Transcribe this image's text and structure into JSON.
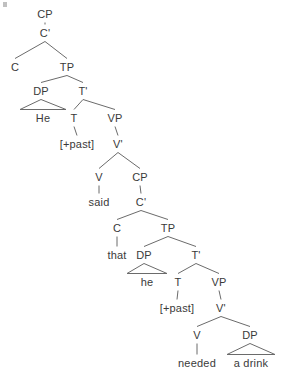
{
  "diagram": {
    "type": "syntax-tree",
    "title": "",
    "sentence": "He said that he needed a drink",
    "line_color": "#6b6b6b",
    "text_color": "#3a3a3a",
    "background": "#ffffff",
    "nodes": [
      {
        "id": "cp1",
        "label": "CP",
        "x": 45,
        "y": 14,
        "kind": "phrase"
      },
      {
        "id": "cbar1",
        "label": "C'",
        "x": 45,
        "y": 33,
        "kind": "phrase"
      },
      {
        "id": "c1",
        "label": "C",
        "x": 15,
        "y": 67,
        "kind": "head"
      },
      {
        "id": "tp1",
        "label": "TP",
        "x": 67,
        "y": 67,
        "kind": "phrase"
      },
      {
        "id": "dp1",
        "label": "DP",
        "x": 41,
        "y": 91,
        "kind": "phrase"
      },
      {
        "id": "tbar1",
        "label": "T'",
        "x": 83,
        "y": 91,
        "kind": "phrase"
      },
      {
        "id": "he1",
        "label": "He",
        "x": 43,
        "y": 118,
        "kind": "terminal"
      },
      {
        "id": "t1",
        "label": "T",
        "x": 74,
        "y": 118,
        "kind": "head"
      },
      {
        "id": "vp1",
        "label": "VP",
        "x": 115,
        "y": 118,
        "kind": "phrase"
      },
      {
        "id": "past1",
        "label": "[+past]",
        "x": 77,
        "y": 144,
        "kind": "terminal"
      },
      {
        "id": "vbar1",
        "label": "V'",
        "x": 118,
        "y": 144,
        "kind": "phrase"
      },
      {
        "id": "v1",
        "label": "V",
        "x": 99,
        "y": 177,
        "kind": "head"
      },
      {
        "id": "cp2",
        "label": "CP",
        "x": 140,
        "y": 177,
        "kind": "phrase"
      },
      {
        "id": "said",
        "label": "said",
        "x": 99,
        "y": 202,
        "kind": "terminal"
      },
      {
        "id": "cbar2",
        "label": "C'",
        "x": 141,
        "y": 202,
        "kind": "phrase"
      },
      {
        "id": "c2",
        "label": "C",
        "x": 117,
        "y": 228,
        "kind": "head"
      },
      {
        "id": "tp2",
        "label": "TP",
        "x": 168,
        "y": 228,
        "kind": "phrase"
      },
      {
        "id": "that",
        "label": "that",
        "x": 117,
        "y": 255,
        "kind": "terminal"
      },
      {
        "id": "dp2",
        "label": "DP",
        "x": 144,
        "y": 255,
        "kind": "phrase"
      },
      {
        "id": "tbar2",
        "label": "T'",
        "x": 196,
        "y": 255,
        "kind": "phrase"
      },
      {
        "id": "he2",
        "label": "he",
        "x": 147,
        "y": 282,
        "kind": "terminal"
      },
      {
        "id": "t2",
        "label": "T",
        "x": 178,
        "y": 282,
        "kind": "head"
      },
      {
        "id": "vp2",
        "label": "VP",
        "x": 219,
        "y": 282,
        "kind": "phrase"
      },
      {
        "id": "past2",
        "label": "[+past]",
        "x": 177,
        "y": 308,
        "kind": "terminal"
      },
      {
        "id": "vbar2",
        "label": "V'",
        "x": 221,
        "y": 308,
        "kind": "phrase"
      },
      {
        "id": "v2",
        "label": "V",
        "x": 197,
        "y": 335,
        "kind": "head"
      },
      {
        "id": "dp3",
        "label": "DP",
        "x": 250,
        "y": 335,
        "kind": "phrase"
      },
      {
        "id": "needed",
        "label": "needed",
        "x": 197,
        "y": 363,
        "kind": "terminal"
      },
      {
        "id": "adrink",
        "label": "a drink",
        "x": 251,
        "y": 363,
        "kind": "terminal"
      }
    ],
    "edges": [
      {
        "from": "cp1",
        "to": "cbar1",
        "style": "line"
      },
      {
        "from": "cbar1",
        "to": "c1",
        "style": "line"
      },
      {
        "from": "cbar1",
        "to": "tp1",
        "style": "line"
      },
      {
        "from": "tp1",
        "to": "dp1",
        "style": "line"
      },
      {
        "from": "tp1",
        "to": "tbar1",
        "style": "line"
      },
      {
        "from": "dp1",
        "to": "he1",
        "style": "triangle"
      },
      {
        "from": "tbar1",
        "to": "t1",
        "style": "line"
      },
      {
        "from": "tbar1",
        "to": "vp1",
        "style": "line"
      },
      {
        "from": "t1",
        "to": "past1",
        "style": "line"
      },
      {
        "from": "vp1",
        "to": "vbar1",
        "style": "line"
      },
      {
        "from": "vbar1",
        "to": "v1",
        "style": "line"
      },
      {
        "from": "vbar1",
        "to": "cp2",
        "style": "line"
      },
      {
        "from": "v1",
        "to": "said",
        "style": "line"
      },
      {
        "from": "cp2",
        "to": "cbar2",
        "style": "line"
      },
      {
        "from": "cbar2",
        "to": "c2",
        "style": "line"
      },
      {
        "from": "cbar2",
        "to": "tp2",
        "style": "line"
      },
      {
        "from": "c2",
        "to": "that",
        "style": "line"
      },
      {
        "from": "tp2",
        "to": "dp2",
        "style": "line"
      },
      {
        "from": "tp2",
        "to": "tbar2",
        "style": "line"
      },
      {
        "from": "dp2",
        "to": "he2",
        "style": "triangle"
      },
      {
        "from": "tbar2",
        "to": "t2",
        "style": "line"
      },
      {
        "from": "tbar2",
        "to": "vp2",
        "style": "line"
      },
      {
        "from": "t2",
        "to": "past2",
        "style": "line"
      },
      {
        "from": "vp2",
        "to": "vbar2",
        "style": "line"
      },
      {
        "from": "vbar2",
        "to": "v2",
        "style": "line"
      },
      {
        "from": "vbar2",
        "to": "dp3",
        "style": "line"
      },
      {
        "from": "v2",
        "to": "needed",
        "style": "line"
      },
      {
        "from": "dp3",
        "to": "adrink",
        "style": "triangle"
      }
    ],
    "triangle_widths": {
      "he1": 46,
      "he2": 40,
      "adrink": 48
    }
  }
}
